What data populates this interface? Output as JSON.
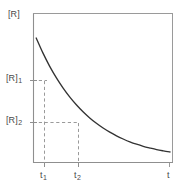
{
  "chart_data": {
    "type": "line",
    "title": "",
    "subtitle": "",
    "xlabel": "t",
    "ylabel": "[R]",
    "grid": false,
    "legend": null,
    "xlim": [
      0,
      1
    ],
    "ylim": [
      0,
      1
    ],
    "series": [
      {
        "name": "[R] vs t",
        "style": "solid",
        "description": "exponential decay curve",
        "x": [
          0.0,
          0.05,
          0.1,
          0.15,
          0.2,
          0.25,
          0.3,
          0.35,
          0.4,
          0.45,
          0.5,
          0.55,
          0.6,
          0.65,
          0.7,
          0.75,
          0.8,
          0.85,
          0.9,
          0.95,
          1.0
        ],
        "y": [
          0.835,
          0.741,
          0.658,
          0.585,
          0.521,
          0.464,
          0.414,
          0.37,
          0.331,
          0.297,
          0.267,
          0.241,
          0.218,
          0.198,
          0.18,
          0.165,
          0.152,
          0.141,
          0.131,
          0.123,
          0.116
        ]
      }
    ],
    "annotations": [
      {
        "name": "R1",
        "label": "[R]",
        "subscript": "1",
        "axis": "y",
        "value": 0.585
      },
      {
        "name": "R2",
        "label": "[R]",
        "subscript": "2",
        "axis": "y",
        "value": 0.305
      },
      {
        "name": "t1",
        "label": "t",
        "subscript": "1",
        "axis": "x",
        "value": 0.079
      },
      {
        "name": "t2",
        "label": "t",
        "subscript": "2",
        "axis": "x",
        "value": 0.323
      }
    ],
    "guide_lines": [
      {
        "name": "r1-horizontal-guide",
        "orientation": "horizontal",
        "from": "y-axis",
        "to": "curve-at-t1",
        "style": "dashed"
      },
      {
        "name": "t1-vertical-guide",
        "orientation": "vertical",
        "from": "curve-at-t1",
        "to": "x-axis",
        "style": "dashed"
      },
      {
        "name": "r2-horizontal-guide",
        "orientation": "horizontal",
        "from": "y-axis",
        "to": "curve-at-t2",
        "style": "dashed"
      },
      {
        "name": "t2-vertical-guide",
        "orientation": "vertical",
        "from": "curve-at-t2",
        "to": "x-axis",
        "style": "dashed"
      }
    ],
    "colors": {
      "curve": "#333333",
      "frame": "#8f8f8f",
      "guide": "#9a9a9a",
      "text": "#4a4a4a",
      "background": "#ffffff"
    }
  },
  "labels": {
    "y_axis": "[R]",
    "x_axis": "t",
    "r1_base": "[R]",
    "r1_sub": "1",
    "r2_base": "[R]",
    "r2_sub": "2",
    "t1_base": "t",
    "t1_sub": "1",
    "t2_base": "t",
    "t2_sub": "2"
  }
}
